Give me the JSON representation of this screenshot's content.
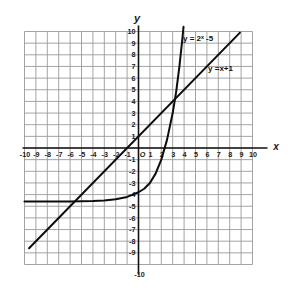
{
  "figure": {
    "type": "cartesian-graph",
    "axis_labels": {
      "x": "x",
      "y": "y"
    },
    "origin_label": "O"
  },
  "chart_data": {
    "type": "line",
    "title": "",
    "xlabel": "x",
    "ylabel": "y",
    "xlim": [
      -10,
      10
    ],
    "ylim": [
      -10,
      10
    ],
    "grid": true,
    "grid_step": 1,
    "legend": "inline-annotations",
    "x_ticks": [
      "-10",
      "-9",
      "-8",
      "-7",
      "-6",
      "-5",
      "-4",
      "-3",
      "-2",
      "-1",
      "O",
      "1",
      "2",
      "3",
      "4",
      "5",
      "6",
      "7",
      "8",
      "9",
      "10"
    ],
    "y_ticks": [
      "10",
      "9",
      "8",
      "7",
      "6",
      "5",
      "4",
      "3",
      "2",
      "1",
      "O",
      "-1",
      "-2",
      "-3",
      "-4",
      "-5",
      "-6",
      "-7",
      "-8",
      "-9",
      "-10"
    ],
    "series": [
      {
        "name": "exponential",
        "label": "y = 2ˣ -5",
        "equation": "y = 2^x - 5",
        "asymptote_y": -4.6,
        "points": [
          {
            "x": -10,
            "y": -4.6
          },
          {
            "x": -8,
            "y": -4.6
          },
          {
            "x": -6,
            "y": -4.59
          },
          {
            "x": -4,
            "y": -4.55
          },
          {
            "x": -3,
            "y": -4.5
          },
          {
            "x": -2,
            "y": -4.4
          },
          {
            "x": -1,
            "y": -4.2
          },
          {
            "x": 0,
            "y": -3.8
          },
          {
            "x": 0.5,
            "y": -3.5
          },
          {
            "x": 1,
            "y": -3.0
          },
          {
            "x": 1.5,
            "y": -2.2
          },
          {
            "x": 2,
            "y": -1.0
          },
          {
            "x": 2.5,
            "y": 0.7
          },
          {
            "x": 3,
            "y": 3.0
          },
          {
            "x": 3.3,
            "y": 4.8
          },
          {
            "x": 3.6,
            "y": 7.1
          },
          {
            "x": 3.85,
            "y": 9.4
          },
          {
            "x": 3.95,
            "y": 10.4
          }
        ]
      },
      {
        "name": "linear",
        "label": "y =x+1",
        "equation": "y = x + 1",
        "slope": 1,
        "intercept": 1,
        "points": [
          {
            "x": -9.6,
            "y": -8.6
          },
          {
            "x": 8.9,
            "y": 9.9
          }
        ]
      }
    ],
    "annotations": [
      {
        "text": "y = 2ˣ -5",
        "x": 3.9,
        "y": 9.2
      },
      {
        "text": "y =x+1",
        "x": 6.1,
        "y": 6.6
      }
    ]
  }
}
